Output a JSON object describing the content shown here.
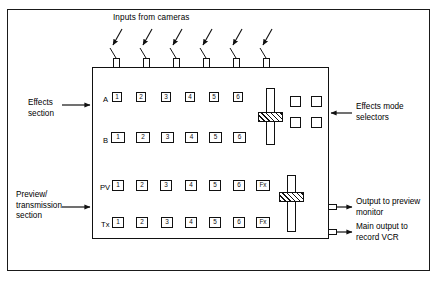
{
  "figure": {
    "line_color": "#111111",
    "background": "#ffffff"
  },
  "top_annotation": {
    "label": "Inputs from cameras",
    "arrow_count": 6,
    "connector_name": "camera-input-connector"
  },
  "left_annotations": [
    {
      "name": "effects-section",
      "lines": [
        "Effects",
        "section"
      ]
    },
    {
      "name": "preview-transmission-section",
      "lines": [
        "Preview/",
        "transmission",
        "section"
      ]
    }
  ],
  "right_annotations": [
    {
      "name": "effects-mode-selectors",
      "lines": [
        "Effects mode",
        "selectors"
      ]
    },
    {
      "name": "output-to-preview-monitor",
      "lines": [
        "Output to preview",
        "monitor"
      ]
    },
    {
      "name": "main-output-to-record-vcr",
      "lines": [
        "Main output to",
        "record VCR"
      ]
    }
  ],
  "bus_rows": [
    {
      "id": "A",
      "label": "A",
      "buttons": [
        "1",
        "2",
        "3",
        "4",
        "5",
        "6"
      ]
    },
    {
      "id": "B",
      "label": "B",
      "buttons": [
        "1",
        "2",
        "3",
        "4",
        "5",
        "6"
      ]
    },
    {
      "id": "PV",
      "label": "PV",
      "buttons": [
        "1",
        "2",
        "3",
        "4",
        "5",
        "6",
        "Fx"
      ]
    },
    {
      "id": "TX",
      "label": "Tx",
      "buttons": [
        "1",
        "2",
        "3",
        "4",
        "5",
        "6",
        "Fx"
      ]
    }
  ],
  "mode_selectors": [
    {
      "name": "effects-mode-selector-1"
    },
    {
      "name": "effects-mode-selector-2"
    },
    {
      "name": "effects-mode-selector-3"
    },
    {
      "name": "effects-mode-selector-4"
    }
  ],
  "faders": [
    {
      "name": "effects-fader",
      "handle_position": "mid-upper"
    },
    {
      "name": "preview-transmission-fader",
      "handle_position": "upper"
    }
  ],
  "outputs": [
    {
      "name": "preview-output-connector"
    },
    {
      "name": "main-output-connector"
    }
  ]
}
